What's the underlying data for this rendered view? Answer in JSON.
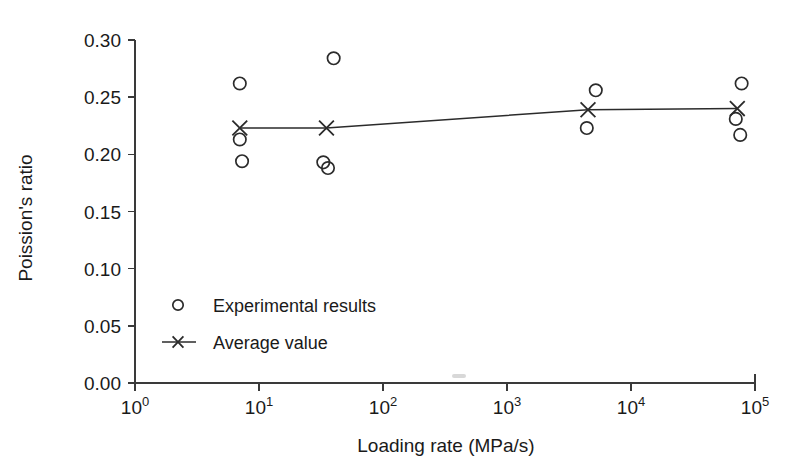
{
  "chart_data": {
    "type": "scatter",
    "title": "",
    "xlabel": "Loading rate (MPa/s)",
    "ylabel": "Poission's ratio",
    "xscale": "log",
    "xlim": [
      1,
      100000
    ],
    "ylim": [
      0.0,
      0.3
    ],
    "grid": false,
    "x_tick_labels": [
      "10",
      "10",
      "10",
      "10",
      "10",
      "10"
    ],
    "x_tick_exponents": [
      "0",
      "1",
      "2",
      "3",
      "4",
      "5"
    ],
    "x_tick_values": [
      1,
      10,
      100,
      1000,
      10000,
      100000
    ],
    "y_tick_labels": [
      "0.00",
      "0.05",
      "0.10",
      "0.15",
      "0.20",
      "0.25",
      "0.30"
    ],
    "y_tick_values": [
      0.0,
      0.05,
      0.1,
      0.15,
      0.2,
      0.25,
      0.3
    ],
    "legend_position": "center-left",
    "series": [
      {
        "name": "Experimental results",
        "marker": "circle",
        "points": [
          {
            "x": 7,
            "y": 0.262
          },
          {
            "x": 7,
            "y": 0.213
          },
          {
            "x": 7.3,
            "y": 0.194
          },
          {
            "x": 40,
            "y": 0.284
          },
          {
            "x": 33,
            "y": 0.193
          },
          {
            "x": 36,
            "y": 0.188
          },
          {
            "x": 5200,
            "y": 0.256
          },
          {
            "x": 4400,
            "y": 0.223
          },
          {
            "x": 78000,
            "y": 0.262
          },
          {
            "x": 70000,
            "y": 0.231
          },
          {
            "x": 76000,
            "y": 0.217
          }
        ]
      },
      {
        "name": "Average value",
        "marker": "cross",
        "line": true,
        "points": [
          {
            "x": 7,
            "y": 0.223
          },
          {
            "x": 35,
            "y": 0.223
          },
          {
            "x": 4500,
            "y": 0.239
          },
          {
            "x": 72000,
            "y": 0.24
          }
        ]
      }
    ]
  },
  "legend": {
    "entries": [
      {
        "label": "Experimental results",
        "marker": "circle"
      },
      {
        "label": "Average value",
        "marker": "cross-line"
      }
    ]
  }
}
